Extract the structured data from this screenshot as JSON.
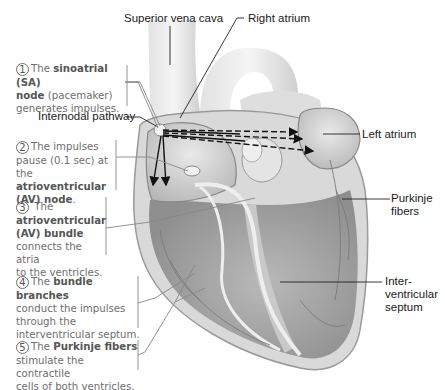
{
  "diagram": {
    "type": "anatomical-illustration",
    "colors": {
      "label_text": "#1a1a1a",
      "step_text": "#6e6e6e",
      "leader_lines": "#222222",
      "step_brackets": "#888888"
    }
  },
  "labels": {
    "superior_vena_cava": "Superior vena cava",
    "right_atrium": "Right atrium",
    "internodal_pathway": "Internodal pathway",
    "left_atrium": "Left atrium",
    "purkinje_fibers_1": "Purkinje",
    "purkinje_fibers_2": "fibers",
    "septum_1": "Inter-",
    "septum_2": "ventricular",
    "septum_3": "septum"
  },
  "steps": [
    {
      "number": "1",
      "pre": "The ",
      "bold": "sinoatrial (SA) node",
      "post": " (pacemaker) generates impulses.",
      "lines": [
        "The",
        "sinoatrial (SA)",
        "node",
        "(pacemaker)",
        "generates impulses."
      ]
    },
    {
      "number": "2",
      "pre": "The impulses pause (0.1 sec) at the ",
      "bold": "atrioventricular (AV) node",
      "post": ".",
      "lines": [
        "The impulses",
        "pause (0.1 sec) at",
        "the",
        "atrioventricular",
        "(AV) node",
        "."
      ]
    },
    {
      "number": "3",
      "pre": "The ",
      "bold": "atrioventricular (AV) bundle",
      "post": " connects the atria to the ventricles.",
      "lines": [
        "The",
        "atrioventricular",
        "(AV) bundle",
        "connects the atria",
        "to the ventricles."
      ]
    },
    {
      "number": "4",
      "pre": "The ",
      "bold": "bundle branches",
      "post": " conduct the impulses through the interventricular septum.",
      "lines": [
        "The",
        "bundle branches",
        "conduct the impulses",
        "through the",
        "interventricular septum."
      ]
    },
    {
      "number": "5",
      "pre": "The ",
      "bold": "Purkinje fibers",
      "post": " stimulate the contractile cells of both ventricles.",
      "lines": [
        "The",
        "Purkinje fibers",
        "stimulate the contractile",
        "cells of both ventricles."
      ]
    }
  ]
}
